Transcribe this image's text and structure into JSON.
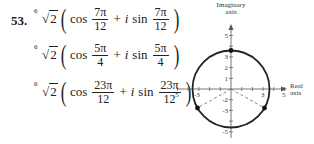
{
  "exercise": {
    "number": "53.",
    "roots": [
      {
        "index": "6",
        "radicand": "2",
        "cos_label": "cos",
        "sin_label": "sin",
        "i": "i",
        "plus": "+",
        "num": "7π",
        "den": "12"
      },
      {
        "index": "6",
        "radicand": "2",
        "cos_label": "cos",
        "sin_label": "sin",
        "i": "i",
        "plus": "+",
        "num": "5π",
        "den": "4"
      },
      {
        "index": "6",
        "radicand": "2",
        "cos_label": "cos",
        "sin_label": "sin",
        "i": "i",
        "plus": "+",
        "num": "23π",
        "den": "12"
      }
    ]
  },
  "diagram": {
    "y_axis_label_line1": "Imaginary",
    "y_axis_label_line2": "axis",
    "x_axis_label_line1": "Real",
    "x_axis_label_line2": "axis",
    "x_ticks": [
      "-5",
      "-3",
      "3",
      "5"
    ],
    "y_ticks": [
      "5",
      "3",
      "2",
      "1",
      "-2",
      "-3",
      "-5"
    ],
    "points": [
      "top",
      "lower-left",
      "lower-right"
    ],
    "colors": {
      "curve": "#222222",
      "axis": "#555555",
      "dashed": "#666666"
    }
  }
}
